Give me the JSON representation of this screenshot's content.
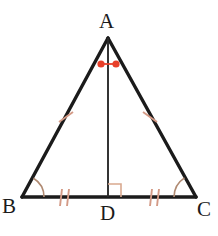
{
  "figure": {
    "background_color": "#ffffff",
    "stroke_color": "#1b1b1b",
    "mark_color": "#d49a86",
    "angle_dot_color": "#e8402a",
    "canvas": {
      "width": 218,
      "height": 236
    }
  },
  "labels": {
    "apex": "A",
    "bottom_left": "B",
    "foot": "D",
    "bottom_right": "C"
  },
  "geometry": {
    "points": {
      "A": {
        "x": 108,
        "y": 38
      },
      "B": {
        "x": 22,
        "y": 197
      },
      "C": {
        "x": 196,
        "y": 197
      },
      "D": {
        "x": 108,
        "y": 197
      }
    },
    "segments": [
      {
        "name": "AB",
        "from": "A",
        "to": "B",
        "width": 3.4
      },
      {
        "name": "AC",
        "from": "A",
        "to": "C",
        "width": 3.4
      },
      {
        "name": "BC",
        "from": "B",
        "to": "C",
        "width": 3.4
      },
      {
        "name": "AD",
        "from": "A",
        "to": "D",
        "width": 1.8
      }
    ]
  },
  "marks": {
    "congruent_sides": [
      {
        "on": "AB",
        "ticks": 1
      },
      {
        "on": "AC",
        "ticks": 1
      }
    ],
    "congruent_base_segments": [
      {
        "on": "BD",
        "ticks": 2
      },
      {
        "on": "DC",
        "ticks": 2
      }
    ],
    "congruent_angles": [
      {
        "at": "B",
        "type": "arc"
      },
      {
        "at": "C",
        "type": "arc"
      }
    ],
    "apex_angle_marks": [
      {
        "at": "A",
        "type": "dot",
        "side": "left"
      },
      {
        "at": "A",
        "type": "dot",
        "side": "right"
      }
    ],
    "right_angle": {
      "at": "D",
      "type": "square",
      "size": 12
    }
  }
}
